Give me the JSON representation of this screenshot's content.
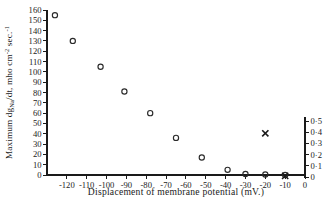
{
  "chart_data": {
    "type": "scatter",
    "title": "",
    "xlabel": "Displacement of membrane potential (mV.)",
    "ylabel": "Maximum dgNa/dt, mho cm⁻² sec.⁻¹",
    "ylabel_parts": {
      "prefix": "Maximum dg",
      "subscript": "Na",
      "middle": "/dt, mho cm",
      "sup1": "-2",
      "middle2": " sec.",
      "sup2": "-1"
    },
    "y2label": "",
    "xlim": [
      -130,
      0
    ],
    "ylim": [
      0,
      160
    ],
    "y2lim": [
      0,
      0.5
    ],
    "grid": false,
    "legend_position": "none",
    "xticks": [
      -120,
      -110,
      -100,
      -90,
      -80,
      -70,
      -60,
      -50,
      -40,
      -30,
      -20,
      -10,
      0
    ],
    "xticklabels": [
      "-120",
      "-110",
      "-100",
      "-90",
      "-80",
      "-70",
      "-60",
      "-50",
      "-40",
      "-30",
      "-20",
      "-10",
      "0"
    ],
    "yticks": [
      0,
      10,
      20,
      30,
      40,
      50,
      60,
      70,
      80,
      90,
      100,
      110,
      120,
      130,
      140,
      150,
      160
    ],
    "yticklabels": [
      "0",
      "10",
      "20",
      "30",
      "40",
      "50",
      "60",
      "70",
      "80",
      "90",
      "100",
      "110",
      "120",
      "130",
      "140",
      "150",
      "160"
    ],
    "y2ticks": [
      0,
      0.1,
      0.2,
      0.3,
      0.4,
      0.5
    ],
    "y2ticklabels": [
      "0",
      "0·1",
      "0·2",
      "0·3",
      "0·4",
      "0·5"
    ],
    "series": [
      {
        "name": "Maximum dgNa/dt",
        "marker": "open-circle",
        "axis": "left",
        "x": [
          -126,
          -117,
          -103,
          -91,
          -78,
          -65,
          -52,
          -39,
          -30,
          -20,
          -10
        ],
        "y": [
          155,
          130,
          105,
          81,
          60,
          36,
          17,
          5,
          1,
          0.5,
          0
        ]
      },
      {
        "name": "Cross markers",
        "marker": "cross",
        "axis": "right",
        "x": [
          -20,
          -10
        ],
        "y": [
          0.39,
          0.01
        ]
      }
    ]
  },
  "axes": {
    "x_axis_name": "x-axis",
    "y_axis_name": "y-axis-left",
    "y2_axis_name": "y-axis-right"
  }
}
